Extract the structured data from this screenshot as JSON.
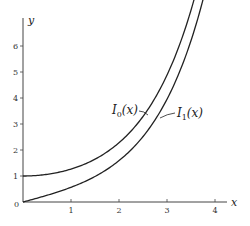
{
  "chart_data": {
    "type": "line",
    "title": "",
    "xlabel": "x",
    "ylabel": "y",
    "xlim": [
      0,
      4.2
    ],
    "ylim": [
      0,
      7
    ],
    "x_ticks": [
      "1",
      "2",
      "3",
      "4"
    ],
    "y_ticks": [
      "1",
      "2",
      "3",
      "4",
      "5",
      "6"
    ],
    "origin_label": "0",
    "grid": false,
    "legend": "inline annotations",
    "series": [
      {
        "name": "I0(x)",
        "label_main": "I",
        "label_sub": "0",
        "label_arg": "(x)",
        "x": [
          0,
          0.5,
          1.0,
          1.5,
          2.0,
          2.5,
          3.0,
          3.25,
          3.5,
          3.6
        ],
        "values": [
          1.0,
          1.064,
          1.266,
          1.647,
          2.28,
          3.29,
          4.881,
          5.96,
          7.378,
          7.0
        ]
      },
      {
        "name": "I1(x)",
        "label_main": "I",
        "label_sub": "1",
        "label_arg": "(x)",
        "x": [
          0,
          0.5,
          1.0,
          1.5,
          2.0,
          2.5,
          3.0,
          3.5,
          3.8
        ],
        "values": [
          0.0,
          0.258,
          0.565,
          0.982,
          1.591,
          2.517,
          3.953,
          6.206,
          7.0
        ]
      }
    ]
  }
}
